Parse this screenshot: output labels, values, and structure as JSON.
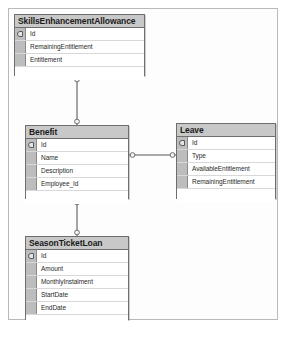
{
  "diagram": {
    "type": "entity-relationship-diagram",
    "notation": "crows-foot",
    "background_color": "#fdfdfd",
    "border_color": "#b9b9b9",
    "header_color": "#c8c8c8",
    "entity_border_color": "#6e6e6e",
    "entities": [
      {
        "id": "skills_enhancement_allowance",
        "name": "SkillsEnhancementAllowance",
        "x": 14,
        "y": 14,
        "width": 131,
        "height": 62,
        "attributes": [
          {
            "name": "Id",
            "key": true
          },
          {
            "name": "RemainingEntitlement",
            "key": false
          },
          {
            "name": "Entitlement",
            "key": false
          }
        ]
      },
      {
        "id": "benefit",
        "name": "Benefit",
        "x": 25,
        "y": 125,
        "width": 104,
        "height": 74,
        "attributes": [
          {
            "name": "Id",
            "key": true
          },
          {
            "name": "Name",
            "key": false
          },
          {
            "name": "Description",
            "key": false
          },
          {
            "name": "Employee_Id",
            "key": false
          }
        ]
      },
      {
        "id": "leave",
        "name": "Leave",
        "x": 176,
        "y": 123,
        "width": 100,
        "height": 76,
        "attributes": [
          {
            "name": "Id",
            "key": true
          },
          {
            "name": "Type",
            "key": false
          },
          {
            "name": "AvailableEntitlement",
            "key": false
          },
          {
            "name": "RemainingEntitlement",
            "key": false
          }
        ]
      },
      {
        "id": "season_ticket_loan",
        "name": "SeasonTicketLoan",
        "x": 25,
        "y": 236,
        "width": 104,
        "height": 84,
        "attributes": [
          {
            "name": "Id",
            "key": true
          },
          {
            "name": "Amount",
            "key": false
          },
          {
            "name": "MonthlyInstalment",
            "key": false
          },
          {
            "name": "StartDate",
            "key": false
          },
          {
            "name": "EndDate",
            "key": false
          }
        ]
      }
    ],
    "relationships": [
      {
        "id": "skills-to-benefit",
        "from": "skills_enhancement_allowance",
        "to": "benefit",
        "orientation": "vertical",
        "from_cardinality": "zero-or-one",
        "to_cardinality": "zero-or-one"
      },
      {
        "id": "benefit-to-leave",
        "from": "benefit",
        "to": "leave",
        "orientation": "horizontal",
        "from_cardinality": "zero-or-one",
        "to_cardinality": "zero-or-one"
      },
      {
        "id": "benefit-to-seasonticketloan",
        "from": "benefit",
        "to": "season_ticket_loan",
        "orientation": "vertical",
        "from_cardinality": "zero-or-one",
        "to_cardinality": "zero-or-one"
      }
    ]
  }
}
